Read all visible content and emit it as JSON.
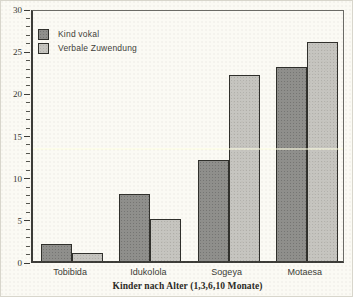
{
  "figure": {
    "background": "#fbfaf4",
    "kind": "scanned-statistics-bar-chart"
  },
  "legend": {
    "position": "top-left",
    "items": [
      {
        "label": "Kind vokal",
        "color": "#8f8f8c"
      },
      {
        "label": "Verbale Zuwendung",
        "color": "#c6c5c0"
      }
    ]
  },
  "chart_data": {
    "type": "bar",
    "title": "",
    "xlabel": "Kinder nach Alter (1,3,6,10 Monate)",
    "ylabel": "",
    "categories": [
      "Tobibida",
      "Idukolola",
      "Sogeya",
      "Motaesa"
    ],
    "series": [
      {
        "name": "Kind vokal",
        "color": "#8f8f8c",
        "values": [
          2,
          8,
          12,
          23
        ]
      },
      {
        "name": "Verbale Zuwendung",
        "color": "#c6c5c0",
        "values": [
          1,
          5,
          22,
          26
        ]
      }
    ],
    "ylim": [
      0,
      30
    ],
    "yticks": [
      "0",
      "5",
      "10",
      "15",
      "20",
      "25",
      "30"
    ],
    "minor_tick_step": 1,
    "grid": false,
    "legend_position": "top-left"
  }
}
